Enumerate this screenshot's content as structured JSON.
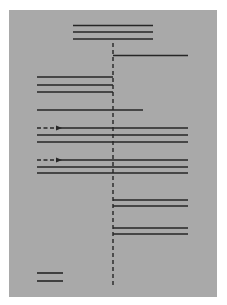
{
  "diagram": {
    "background": "#a9a9a9",
    "line_color": "#262626",
    "panel": {
      "x": 9,
      "y": 10,
      "w": 208,
      "h": 287
    },
    "axis": {
      "x": 113,
      "y1": 43,
      "y2": 287,
      "dash": "4,3"
    },
    "lines": [
      {
        "id": "top-1",
        "x1": 73,
        "x2": 153,
        "y": 25.5
      },
      {
        "id": "top-2",
        "x1": 73,
        "x2": 153,
        "y": 32
      },
      {
        "id": "top-3",
        "x1": 73,
        "x2": 153,
        "y": 39
      },
      {
        "id": "right-1",
        "x1": 113,
        "x2": 188,
        "y": 55.5
      },
      {
        "id": "left-1",
        "x1": 37,
        "x2": 113,
        "y": 77
      },
      {
        "id": "left-2",
        "x1": 37,
        "x2": 113,
        "y": 85
      },
      {
        "id": "left-3",
        "x1": 37,
        "x2": 113,
        "y": 92
      },
      {
        "id": "mid-1",
        "x1": 37,
        "x2": 143,
        "y": 110
      },
      {
        "id": "groupA-1",
        "x1": 60,
        "x2": 188,
        "y": 128
      },
      {
        "id": "groupA-2",
        "x1": 37,
        "x2": 188,
        "y": 135
      },
      {
        "id": "groupA-3",
        "x1": 37,
        "x2": 188,
        "y": 142
      },
      {
        "id": "groupB-1",
        "x1": 60,
        "x2": 188,
        "y": 160
      },
      {
        "id": "groupB-2",
        "x1": 37,
        "x2": 188,
        "y": 167
      },
      {
        "id": "groupB-3",
        "x1": 37,
        "x2": 188,
        "y": 173
      },
      {
        "id": "right-2",
        "x1": 113,
        "x2": 188,
        "y": 200
      },
      {
        "id": "right-3",
        "x1": 113,
        "x2": 188,
        "y": 206
      },
      {
        "id": "right-4",
        "x1": 113,
        "x2": 188,
        "y": 228
      },
      {
        "id": "right-5",
        "x1": 113,
        "x2": 188,
        "y": 234
      },
      {
        "id": "short-1",
        "x1": 37,
        "x2": 63,
        "y": 273
      },
      {
        "id": "short-2",
        "x1": 37,
        "x2": 63,
        "y": 281
      }
    ],
    "dashed_arrows": [
      {
        "id": "arrow-A",
        "x1": 37,
        "x2": 61,
        "y": 128
      },
      {
        "id": "arrow-B",
        "x1": 37,
        "x2": 61,
        "y": 160
      }
    ]
  }
}
